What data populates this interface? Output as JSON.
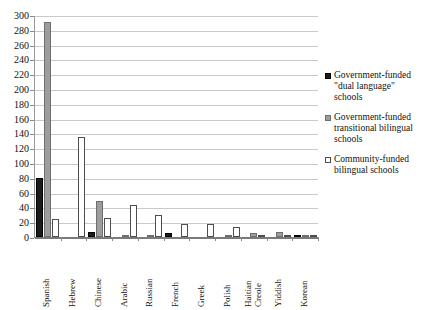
{
  "chart_data": {
    "type": "bar",
    "title": "",
    "xlabel": "",
    "ylabel": "",
    "ylim": [
      0,
      300
    ],
    "ytick_step": 20,
    "yticks": [
      "300",
      "280",
      "260",
      "240",
      "220",
      "200",
      "180",
      "160",
      "140",
      "120",
      "100",
      "80",
      "60",
      "40",
      "20",
      "0"
    ],
    "grid": true,
    "legend_position": "right",
    "categories": [
      "Spanish",
      "Hebrew",
      "Chinese",
      "Arabic",
      "Russian",
      "French",
      "Greek",
      "Polish",
      "Haitian\nCreole",
      "Yiddish",
      "Korean"
    ],
    "series": [
      {
        "name": "Government-funded\n\"dual language\"\nschools",
        "color": "#1b1b1b",
        "values": [
          80,
          0,
          7,
          0,
          0,
          6,
          0,
          0,
          0,
          0,
          1
        ]
      },
      {
        "name": "Government-funded\ntransitional bilingual\nschools",
        "color": "#9d9d9d",
        "values": [
          290,
          0,
          49,
          2,
          1,
          0,
          0,
          2,
          5,
          7,
          2
        ]
      },
      {
        "name": "Community-funded\nbilingual schools",
        "color": "#ffffff",
        "values": [
          24,
          135,
          26,
          43,
          30,
          17,
          17,
          14,
          1,
          1,
          1
        ]
      }
    ]
  },
  "legend": {
    "items": [
      {
        "label": "Government-funded\n\"dual language\"\nschools",
        "swatch": "s0"
      },
      {
        "label": "Government-funded\ntransitional bilingual\nschools",
        "swatch": "s1"
      },
      {
        "label": "Community-funded\nbilingual schools",
        "swatch": "s2"
      }
    ]
  }
}
